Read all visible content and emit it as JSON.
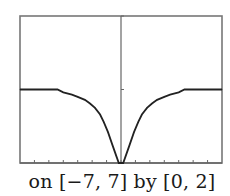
{
  "caption": "on [−7, 7] by [0, 2]",
  "chart_data": {
    "type": "line",
    "title": "",
    "xlabel": "",
    "ylabel": "",
    "xlim": [
      -7,
      7
    ],
    "ylim": [
      0,
      2
    ],
    "x_ticks": [
      -7,
      -6,
      -5,
      -4,
      -3,
      -2,
      -1,
      0,
      1,
      2,
      3,
      4,
      5,
      6,
      7
    ],
    "y_ticks": [
      0,
      1,
      2
    ],
    "grid": false,
    "colors": {
      "frame": "#777777",
      "curve": "#222222",
      "axis": "#666666"
    },
    "series": [
      {
        "name": "f(x)",
        "x": [
          -7,
          -6,
          -5,
          -4.4,
          -4,
          -3.4,
          -3,
          -2.5,
          -2.15,
          -1.8,
          -1.45,
          -1.2,
          -0.9,
          -0.6,
          -0.3,
          -0.15,
          0,
          0.15,
          0.3,
          0.6,
          0.9,
          1.2,
          1.45,
          1.8,
          2.15,
          2.5,
          3,
          3.4,
          4,
          4.4,
          5,
          6,
          7
        ],
        "y": [
          1.0,
          1.0,
          1.0,
          1.0,
          0.96,
          0.93,
          0.9,
          0.86,
          0.81,
          0.75,
          0.66,
          0.56,
          0.42,
          0.25,
          0.08,
          0.0,
          0.0,
          0.0,
          0.08,
          0.25,
          0.42,
          0.56,
          0.66,
          0.75,
          0.81,
          0.86,
          0.9,
          0.93,
          0.96,
          1.0,
          1.0,
          1.0,
          1.0
        ]
      }
    ]
  }
}
